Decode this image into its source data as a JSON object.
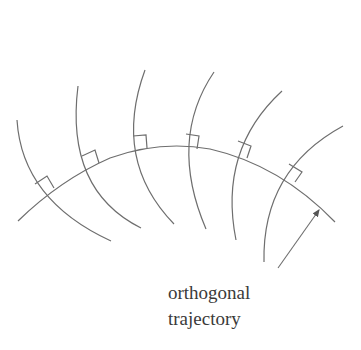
{
  "diagram": {
    "label_line1": "orthogonal",
    "label_line2": "trajectory",
    "stroke_color": "#6e6e6e",
    "family_curve_count": 6,
    "right_angle_markers": 6
  }
}
